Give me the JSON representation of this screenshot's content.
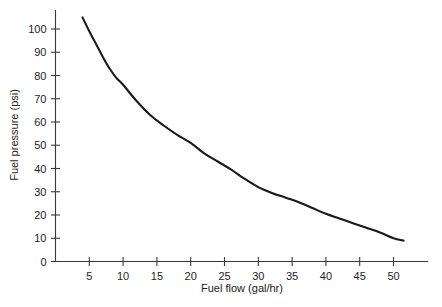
{
  "chart_data": {
    "type": "line",
    "title": "",
    "subtitle": "",
    "xlabel": "Fuel flow (gal/hr)",
    "ylabel": "Fuel pressure (psi)",
    "xlim": [
      0,
      55
    ],
    "ylim": [
      0,
      110
    ],
    "xticks": [
      5,
      10,
      15,
      20,
      25,
      30,
      35,
      40,
      45,
      50
    ],
    "yticks": [
      0,
      10,
      20,
      30,
      40,
      50,
      60,
      70,
      80,
      90,
      100
    ],
    "xtick_labels": [
      "5",
      "10",
      "15",
      "20",
      "25",
      "30",
      "35",
      "40",
      "45",
      "50"
    ],
    "ytick_labels": [
      "0",
      "10",
      "20",
      "30",
      "40",
      "50",
      "60",
      "70",
      "80",
      "90",
      "100"
    ],
    "grid": false,
    "legend": false,
    "legend_position": "none",
    "series": [
      {
        "name": "Fuel pressure vs fuel flow",
        "color": "#1a1a1a",
        "x": [
          4.0,
          5.0,
          6.0,
          7.0,
          8.0,
          9.0,
          10.0,
          12.0,
          14.0,
          16.0,
          18.0,
          20.0,
          22.0,
          24.0,
          26.0,
          28.0,
          30.0,
          32.0,
          34.0,
          36.0,
          38.0,
          40.0,
          42.0,
          44.0,
          46.0,
          48.0,
          50.0,
          51.5
        ],
        "y": [
          105.0,
          99.0,
          93.5,
          88.0,
          83.0,
          79.0,
          76.0,
          69.0,
          63.0,
          58.5,
          54.5,
          51.0,
          46.5,
          43.0,
          39.5,
          35.5,
          32.0,
          29.5,
          27.5,
          25.5,
          23.0,
          20.5,
          18.5,
          16.5,
          14.5,
          12.5,
          10.0,
          9.0
        ]
      }
    ]
  },
  "axes": {
    "x_title": "Fuel flow (gal/hr)",
    "y_title": "Fuel pressure (psi)"
  }
}
